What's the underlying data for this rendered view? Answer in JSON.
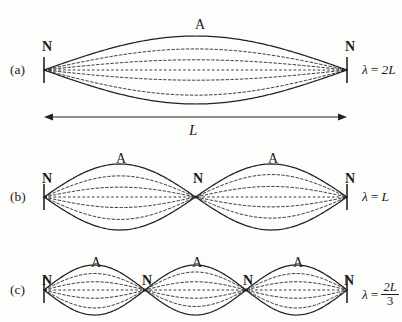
{
  "figure": {
    "length_label": "L",
    "node_label": "N",
    "antinode_label": "A",
    "stroke_color": "#222222",
    "background_color": "#fdfdfc"
  },
  "panels": [
    {
      "tag": "(a)",
      "harmonic": 1,
      "loops": 2,
      "wavelength": {
        "symbol": "λ",
        "equals": "=",
        "value": "2L",
        "is_fraction": false,
        "numerator": "",
        "denominator": ""
      },
      "nodes": [
        "N",
        "N"
      ],
      "antinodes": [
        "A"
      ]
    },
    {
      "tag": "(b)",
      "harmonic": 2,
      "loops": 2,
      "wavelength": {
        "symbol": "λ",
        "equals": "=",
        "value": "L",
        "is_fraction": false,
        "numerator": "",
        "denominator": ""
      },
      "nodes": [
        "N",
        "N",
        "N"
      ],
      "antinodes": [
        "A",
        "A"
      ]
    },
    {
      "tag": "(c)",
      "harmonic": 3,
      "loops": 3,
      "wavelength": {
        "symbol": "λ",
        "equals": "=",
        "value": "",
        "is_fraction": true,
        "numerator": "2L",
        "denominator": "3"
      },
      "nodes": [
        "N",
        "N",
        "N",
        "N"
      ],
      "antinodes": [
        "A",
        "A",
        "A"
      ]
    }
  ],
  "chart_data": {
    "type": "line",
    "xlabel": "position along string",
    "ylabel": "displacement",
    "x_range_px": [
      44,
      347
    ],
    "string_length_px": 303,
    "panels": [
      {
        "tag": "(a)",
        "centerline_y_px": 70,
        "max_amplitude_px": 34,
        "half_wavelengths": 1,
        "node_positions_px": [
          44,
          347
        ],
        "antinode_positions_px": [
          195.5
        ],
        "antinode_label_px": [
          {
            "x": 195,
            "y": 18
          }
        ],
        "node_label_px": [
          {
            "x": 42,
            "y": 40
          },
          {
            "x": 345,
            "y": 40
          }
        ],
        "envelope_fractions": [
          1.0,
          0.62,
          0.3,
          -0.3,
          -0.74
        ],
        "solid_index": 0
      },
      {
        "tag": "(b)",
        "centerline_y_px": 197,
        "max_amplitude_px": 33,
        "half_wavelengths": 2,
        "node_positions_px": [
          44,
          195.5,
          347
        ],
        "antinode_positions_px": [
          119.75,
          271.25
        ],
        "antinode_label_px": [
          {
            "x": 116,
            "y": 152
          },
          {
            "x": 268,
            "y": 152
          }
        ],
        "node_label_px": [
          {
            "x": 42,
            "y": 172
          },
          {
            "x": 193,
            "y": 172
          },
          {
            "x": 345,
            "y": 172
          }
        ],
        "envelope_fractions": [
          1.0,
          0.64,
          0.3,
          -0.32,
          -0.68
        ],
        "solid_index": 0
      },
      {
        "tag": "(c)",
        "centerline_y_px": 290,
        "max_amplitude_px": 25,
        "half_wavelengths": 3,
        "node_positions_px": [
          44,
          145,
          246,
          347
        ],
        "antinode_positions_px": [
          94.5,
          195.5,
          296.5
        ],
        "antinode_label_px": [
          {
            "x": 91,
            "y": 256
          },
          {
            "x": 192,
            "y": 256
          },
          {
            "x": 293,
            "y": 256
          }
        ],
        "node_label_px": [
          {
            "x": 42,
            "y": 274
          },
          {
            "x": 142,
            "y": 274
          },
          {
            "x": 243,
            "y": 274
          },
          {
            "x": 344,
            "y": 274
          }
        ],
        "envelope_fractions": [
          1.0,
          0.66,
          0.33,
          -0.33,
          -0.72
        ],
        "solid_index": 0
      }
    ],
    "length_arrow": {
      "x1_px": 44,
      "x2_px": 347,
      "y_px": 117,
      "label": "L",
      "label_px": {
        "x": 189,
        "y": 123
      }
    }
  }
}
